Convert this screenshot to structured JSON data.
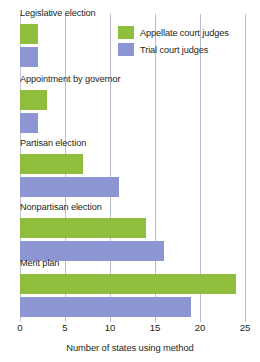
{
  "chart_data": {
    "type": "bar",
    "orientation": "horizontal",
    "title": "",
    "xlabel": "Number of states using method",
    "ylabel": "",
    "xlim": [
      0,
      25
    ],
    "xticks": [
      0,
      5,
      10,
      15,
      20,
      25
    ],
    "grid": true,
    "legend_position": "top-right",
    "categories": [
      "Legislative election",
      "Appointment by governor",
      "Partisan election",
      "Nonpartisan election",
      "Merit plan"
    ],
    "series": [
      {
        "name": "Appellate court judges",
        "color": "#8fbe3f",
        "values": [
          2,
          3,
          7,
          14,
          24
        ]
      },
      {
        "name": "Trial court judges",
        "color": "#8d95d2",
        "values": [
          2,
          2,
          11,
          16,
          19
        ]
      }
    ]
  },
  "colors": {
    "appellate": "#8fbe3f",
    "trial": "#8d95d2",
    "gridline": "#b9bcd8",
    "text": "#231f20",
    "background": "#ffffff"
  }
}
